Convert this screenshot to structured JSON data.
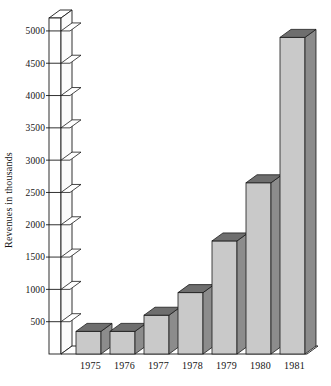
{
  "chart_data": {
    "type": "bar",
    "title": "",
    "subtitle": "",
    "xlabel": "",
    "ylabel": "Revenues in thousands",
    "categories": [
      "1975",
      "1976",
      "1977",
      "1978",
      "1979",
      "1980",
      "1981"
    ],
    "values": [
      350,
      350,
      600,
      950,
      1750,
      2650,
      4900
    ],
    "series": [
      {
        "name": "Revenues",
        "values": [
          350,
          350,
          600,
          950,
          1750,
          2650,
          4900
        ]
      }
    ],
    "ylim": [
      0,
      5200
    ],
    "ytick_values": [
      500,
      1000,
      1500,
      2000,
      2500,
      3000,
      3500,
      4000,
      4500,
      5000
    ],
    "ytick_labels": [
      "500",
      "1000",
      "1500",
      "2000",
      "2500",
      "3000",
      "3500",
      "4000",
      "4500",
      "5000"
    ],
    "grid": false,
    "legend": false,
    "legend_position": "none",
    "style": "3d-isometric-bars",
    "colors": {
      "bar_front": "#c9c9c9",
      "bar_side": "#8c8c8c",
      "bar_top": "#6e6e6e",
      "outline": "#1a1a1a",
      "background": "#ffffff",
      "text": "#141414"
    }
  },
  "axis": {
    "y_title": "Revenues in thousands",
    "ticks": [
      {
        "label": "5000",
        "value": 5000
      },
      {
        "label": "4500",
        "value": 4500
      },
      {
        "label": "4000",
        "value": 4000
      },
      {
        "label": "3500",
        "value": 3500
      },
      {
        "label": "3000",
        "value": 3000
      },
      {
        "label": "2500",
        "value": 2500
      },
      {
        "label": "2000",
        "value": 2000
      },
      {
        "label": "1500",
        "value": 1500
      },
      {
        "label": "1000",
        "value": 1000
      },
      {
        "label": "500",
        "value": 500
      }
    ],
    "categories": [
      {
        "label": "1975"
      },
      {
        "label": "1976"
      },
      {
        "label": "1977"
      },
      {
        "label": "1978"
      },
      {
        "label": "1979"
      },
      {
        "label": "1980"
      },
      {
        "label": "1981"
      }
    ]
  }
}
